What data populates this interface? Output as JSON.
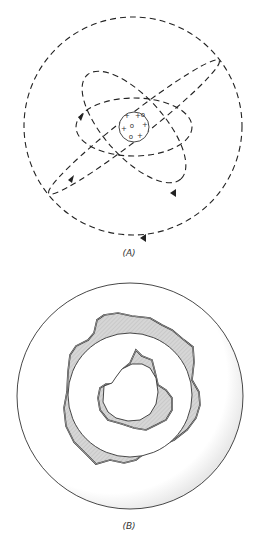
{
  "figure": {
    "panel_a": {
      "caption": "(A)",
      "description": "Planetary model of the atom: nucleus with protons and neutrons, electrons on dashed elliptical orbits",
      "nucleus_symbols": [
        "+",
        "o",
        "+",
        "o",
        "+",
        "o",
        "+",
        "+"
      ]
    },
    "panel_b": {
      "caption": "(B)",
      "description": "Cross-section with shaded irregular shells around concentric circular regions"
    },
    "colors": {
      "line": "#222222",
      "shade": "#cfcfcf",
      "shadow": "#eeeeee"
    }
  }
}
